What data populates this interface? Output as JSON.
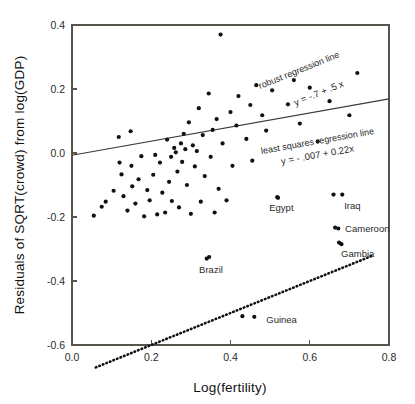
{
  "chart_data": {
    "type": "scatter",
    "title": "",
    "xlabel": "Log(fertility)",
    "ylabel": "Residuals of SQRT(crowd) from log(GDP)",
    "xlim": [
      0.0,
      0.8
    ],
    "ylim": [
      -0.6,
      0.4
    ],
    "xticks": [
      "0.0",
      "0.2",
      "0.4",
      "0.6",
      "0.8"
    ],
    "xtick_values": [
      0.0,
      0.2,
      0.4,
      0.6,
      0.8
    ],
    "yticks": [
      "0.4",
      "0.2",
      "0.0",
      "-0.2",
      "-0.4",
      "-0.6"
    ],
    "ytick_values": [
      0.4,
      0.2,
      0.0,
      -0.2,
      -0.4,
      -0.6
    ],
    "grid": false,
    "legend_position": "none",
    "points": [
      [
        0.055,
        -0.196
      ],
      [
        0.075,
        -0.168
      ],
      [
        0.085,
        -0.152
      ],
      [
        0.105,
        -0.118
      ],
      [
        0.118,
        0.05
      ],
      [
        0.12,
        -0.03
      ],
      [
        0.125,
        -0.067
      ],
      [
        0.13,
        -0.135
      ],
      [
        0.14,
        -0.18
      ],
      [
        0.148,
        0.068
      ],
      [
        0.15,
        -0.04
      ],
      [
        0.152,
        -0.104
      ],
      [
        0.16,
        -0.158
      ],
      [
        0.168,
        -0.082
      ],
      [
        0.175,
        -0.01
      ],
      [
        0.182,
        -0.198
      ],
      [
        0.19,
        -0.116
      ],
      [
        0.196,
        -0.148
      ],
      [
        0.205,
        -0.068
      ],
      [
        0.21,
        -0.006
      ],
      [
        0.215,
        -0.192
      ],
      [
        0.222,
        -0.03
      ],
      [
        0.228,
        -0.124
      ],
      [
        0.235,
        -0.186
      ],
      [
        0.24,
        0.042
      ],
      [
        0.245,
        -0.09
      ],
      [
        0.25,
        -0.012
      ],
      [
        0.252,
        -0.15
      ],
      [
        0.258,
        0.016
      ],
      [
        0.262,
        0.002
      ],
      [
        0.266,
        -0.058
      ],
      [
        0.27,
        -0.17
      ],
      [
        0.275,
        0.03
      ],
      [
        0.278,
        -0.028
      ],
      [
        0.282,
        0.06
      ],
      [
        0.286,
        0.012
      ],
      [
        0.29,
        -0.1
      ],
      [
        0.295,
        0.096
      ],
      [
        0.3,
        -0.19
      ],
      [
        0.305,
        0.024
      ],
      [
        0.31,
        -0.042
      ],
      [
        0.315,
        0.006
      ],
      [
        0.32,
        0.14
      ],
      [
        0.325,
        -0.152
      ],
      [
        0.33,
        0.056
      ],
      [
        0.335,
        -0.072
      ],
      [
        0.34,
        -0.33
      ],
      [
        0.345,
        0.186
      ],
      [
        0.35,
        -0.012
      ],
      [
        0.355,
        0.072
      ],
      [
        0.36,
        -0.186
      ],
      [
        0.365,
        0.106
      ],
      [
        0.37,
        -0.112
      ],
      [
        0.375,
        0.37
      ],
      [
        0.38,
        0.03
      ],
      [
        0.39,
        -0.148
      ],
      [
        0.4,
        0.128
      ],
      [
        0.405,
        -0.04
      ],
      [
        0.415,
        0.086
      ],
      [
        0.42,
        0.178
      ],
      [
        0.43,
        -0.51
      ],
      [
        0.44,
        0.044
      ],
      [
        0.45,
        0.15
      ],
      [
        0.455,
        -0.024
      ],
      [
        0.465,
        0.212
      ],
      [
        0.48,
        0.118
      ],
      [
        0.49,
        0.07
      ],
      [
        0.505,
        0.196
      ],
      [
        0.52,
        -0.14
      ],
      [
        0.545,
        0.152
      ],
      [
        0.56,
        0.228
      ],
      [
        0.575,
        0.092
      ],
      [
        0.6,
        0.204
      ],
      [
        0.62,
        0.036
      ],
      [
        0.65,
        0.162
      ],
      [
        0.66,
        -0.13
      ],
      [
        0.672,
        -0.236
      ],
      [
        0.68,
        -0.285
      ],
      [
        0.7,
        0.118
      ],
      [
        0.72,
        0.25
      ]
    ],
    "annotated_points": [
      {
        "label": "Egypt",
        "x": 0.518,
        "y": -0.138,
        "label_dx": -8,
        "label_dy": 14
      },
      {
        "label": "Iraq",
        "x": 0.682,
        "y": -0.13,
        "label_dx": 2,
        "label_dy": 14
      },
      {
        "label": "Cameroon",
        "x": 0.664,
        "y": -0.233,
        "label_dx": 10,
        "label_dy": 4
      },
      {
        "label": "Gambia",
        "x": 0.674,
        "y": -0.28,
        "label_dx": 2,
        "label_dy": 14
      },
      {
        "label": "Brazil",
        "x": 0.346,
        "y": -0.325,
        "label_dx": -10,
        "label_dy": 16
      },
      {
        "label": "Guinea",
        "x": 0.46,
        "y": -0.512,
        "label_dx": 12,
        "label_dy": 6
      }
    ],
    "series": [
      {
        "name": "robust regression line",
        "type": "line",
        "style": "dotted",
        "label": "robust regression line",
        "equation": "y = -.7 + .5 x",
        "intercept": -0.7,
        "slope": 0.5,
        "x_start": 0.06,
        "x_end": 0.76
      },
      {
        "name": "least squares regression line",
        "type": "line",
        "style": "solid",
        "label": "least squares regression line",
        "equation": "y = - .007 + 0.22x",
        "intercept": -0.007,
        "slope": 0.22,
        "x_start": 0.0,
        "x_end": 0.8
      }
    ]
  }
}
